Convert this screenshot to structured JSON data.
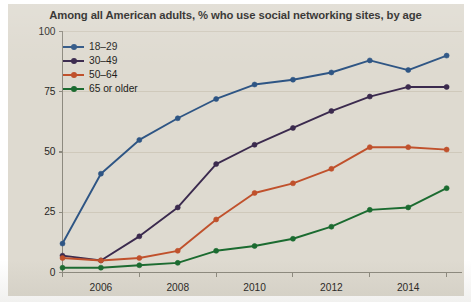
{
  "figure": {
    "title": "Among all American adults, % who use social networking sites, by age",
    "background_color": "#dedad0",
    "axis_color": "#8d8a7f",
    "text_color": "#1d1c1a"
  },
  "legend": {
    "position": "top-left",
    "entries": [
      {
        "label": "18–29",
        "color": "#2e5584"
      },
      {
        "label": "30–49",
        "color": "#3b2a4e"
      },
      {
        "label": "50–64",
        "color": "#c0512c"
      },
      {
        "label": "65 or older",
        "color": "#1b6b30"
      }
    ]
  },
  "axes": {
    "y": {
      "ticks": [
        0,
        25,
        50,
        75,
        100
      ],
      "tick_labels": [
        "0",
        "25",
        "50",
        "75",
        "100"
      ],
      "range": [
        0,
        100
      ],
      "gridlines": true
    },
    "x": {
      "major_ticks": [
        2006,
        2008,
        2010,
        2012,
        2014
      ],
      "major_tick_labels": [
        "2006",
        "2008",
        "2010",
        "2012",
        "2014"
      ],
      "minor_ticks": [
        2005,
        2007,
        2009,
        2011,
        2013,
        2015
      ],
      "range": [
        2005,
        2015.4
      ]
    }
  },
  "chart_data": {
    "type": "line",
    "title": "Among all American adults, % who use social networking sites, by age",
    "xlabel": "",
    "ylabel": "",
    "ylim": [
      0,
      100
    ],
    "xlim": [
      2005,
      2015.4
    ],
    "grid": true,
    "legend_position": "top-left",
    "x": [
      2005,
      2006,
      2007,
      2008,
      2009,
      2010,
      2011,
      2012,
      2013,
      2014,
      2015
    ],
    "series": [
      {
        "name": "18–29",
        "color": "#2e5584",
        "values": [
          12,
          41,
          55,
          64,
          72,
          78,
          80,
          83,
          88,
          84,
          90
        ]
      },
      {
        "name": "30–49",
        "color": "#3b2a4e",
        "values": [
          7,
          5,
          15,
          27,
          45,
          53,
          60,
          67,
          73,
          77,
          77
        ]
      },
      {
        "name": "50–64",
        "color": "#c0512c",
        "values": [
          6,
          5,
          6,
          9,
          22,
          33,
          37,
          43,
          52,
          52,
          51
        ]
      },
      {
        "name": "65 or older",
        "color": "#1b6b30",
        "values": [
          2,
          2,
          3,
          4,
          9,
          11,
          14,
          19,
          26,
          27,
          35
        ]
      }
    ]
  }
}
